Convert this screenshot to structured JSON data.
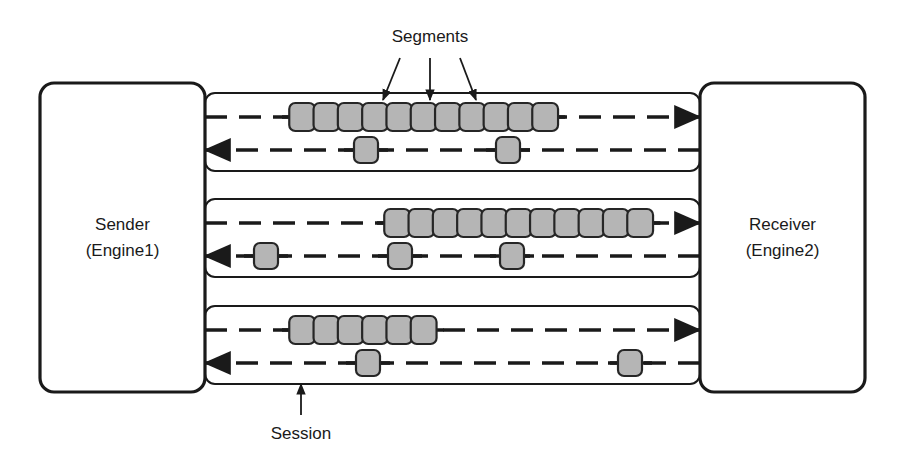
{
  "diagram": {
    "colors": {
      "background": "#ffffff",
      "stroke": "#1a1a1a",
      "segment_fill": "#b5b5b5",
      "segment_stroke": "#262626",
      "box_fill": "#ffffff"
    },
    "endpoints": {
      "sender": {
        "name": "sender-node",
        "line1": "Sender",
        "line2": "(Engine1)",
        "x": 40,
        "y": 83,
        "w": 165,
        "h": 309,
        "r": 14
      },
      "receiver": {
        "name": "receiver-node",
        "line1": "Receiver",
        "line2": "(Engine2)",
        "x": 700,
        "y": 83,
        "w": 165,
        "h": 309,
        "r": 14
      }
    },
    "annotations": {
      "segments": {
        "label": "Segments",
        "label_x": 430,
        "label_y": 38,
        "arrows": [
          {
            "x1": 400,
            "y1": 58,
            "x2": 383,
            "y2": 100
          },
          {
            "x1": 430,
            "y1": 58,
            "x2": 430,
            "y2": 100
          },
          {
            "x1": 460,
            "y1": 58,
            "x2": 476,
            "y2": 100
          }
        ]
      },
      "session": {
        "label": "Session",
        "label_x": 301,
        "label_y": 435,
        "arrow": {
          "x1": 301,
          "y1": 415,
          "x2": 301,
          "y2": 384
        }
      }
    },
    "sessions": [
      {
        "name": "session-1",
        "box": {
          "x": 205,
          "y": 93,
          "w": 495,
          "h": 78,
          "r": 10
        },
        "forward": {
          "name": "forward-lane-1",
          "y": 117,
          "x_start": 205,
          "x_end": 700,
          "direction": "right",
          "segment_count": 11,
          "segments_x_start": 290,
          "segment_w": 24.3,
          "segment_h": 28
        },
        "reverse": {
          "name": "reverse-lane-1",
          "y": 150,
          "x_start": 205,
          "x_end": 700,
          "direction": "left",
          "segment_count": 2,
          "segments_x": [
            366,
            508
          ],
          "segment_w": 24,
          "segment_h": 26
        }
      },
      {
        "name": "session-2",
        "box": {
          "x": 205,
          "y": 199,
          "w": 495,
          "h": 78,
          "r": 10
        },
        "forward": {
          "name": "forward-lane-2",
          "y": 223,
          "x_start": 205,
          "x_end": 700,
          "direction": "right",
          "segment_count": 11,
          "segments_x_start": 385,
          "segment_w": 24.3,
          "segment_h": 28
        },
        "reverse": {
          "name": "reverse-lane-2",
          "y": 256,
          "x_start": 205,
          "x_end": 700,
          "direction": "left",
          "segment_count": 3,
          "segments_x": [
            266,
            400,
            512
          ],
          "segment_w": 24,
          "segment_h": 26
        }
      },
      {
        "name": "session-3",
        "box": {
          "x": 205,
          "y": 306,
          "w": 495,
          "h": 78,
          "r": 10
        },
        "forward": {
          "name": "forward-lane-3",
          "y": 330,
          "x_start": 205,
          "x_end": 700,
          "direction": "right",
          "segment_count": 6,
          "segments_x_start": 290,
          "segment_w": 24.3,
          "segment_h": 28
        },
        "reverse": {
          "name": "reverse-lane-3",
          "y": 363,
          "x_start": 205,
          "x_end": 700,
          "direction": "left",
          "segment_count": 2,
          "segments_x": [
            368,
            630
          ],
          "segment_w": 24,
          "segment_h": 26
        }
      }
    ]
  }
}
